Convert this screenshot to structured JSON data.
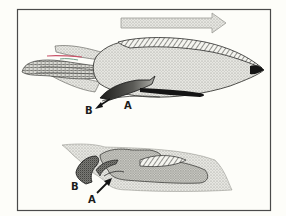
{
  "figure": {
    "colors": {
      "background": "#fdfdf9",
      "frame": "#4a4a4a",
      "stipple_light": "#d9d9d3",
      "stipple_mid": "#b9b9b3",
      "stipple_dark": "#6d6d68",
      "ink": "#141414",
      "accent_red": "#c9546a",
      "accent_green": "#6f9a85"
    },
    "direction_arrow": {
      "icon": "right-arrow-icon",
      "direction": "right"
    },
    "top_diagram": {
      "subject": "squid",
      "labels": [
        {
          "id": "B",
          "text": "B"
        },
        {
          "id": "A",
          "text": "A"
        }
      ],
      "flow_arrow": {
        "icon": "down-left-arrow-icon",
        "direction": "down-left"
      }
    },
    "bottom_diagram": {
      "subject": "squid-funnel-detail",
      "labels": [
        {
          "id": "B",
          "text": "B"
        },
        {
          "id": "A",
          "text": "A"
        }
      ],
      "flow_arrow": {
        "icon": "up-right-arrow-icon",
        "direction": "up-right"
      }
    }
  }
}
